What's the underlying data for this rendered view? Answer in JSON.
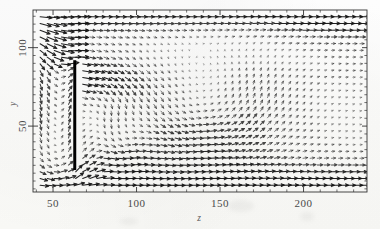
{
  "figure": {
    "name": "velocity-vector-field",
    "background_color": "#fdfdfc",
    "ink_color": "#1a1a1a"
  },
  "chart_data": {
    "type": "quiver",
    "title": "",
    "subtitle": "",
    "xlabel": "z",
    "ylabel": "y",
    "xlim": [
      38,
      238
    ],
    "ylim": [
      8,
      124
    ],
    "grid": false,
    "legend": null,
    "xticks": [
      50,
      100,
      150,
      200
    ],
    "xtick_labels": [
      "50",
      "100",
      "150",
      "200"
    ],
    "yticks": [
      50,
      100
    ],
    "ytick_labels": [
      "50",
      "100"
    ],
    "x_minor_tick_step": 10,
    "y_minor_tick_step": 5,
    "annotations": [
      {
        "name": "vertical-plate",
        "type": "thick-line-segment",
        "x": 63,
        "y_start": 22,
        "y_end": 92,
        "color": "#000000",
        "line_width_px": 3
      }
    ],
    "grid_nx": 46,
    "grid_ny": 26,
    "arrow_scale": 7.4,
    "vortex_center": {
      "z": 138,
      "y": 64
    },
    "secondary_vortex_center": {
      "z": 88,
      "y": 40
    }
  },
  "axes": {
    "x_title": "z",
    "y_title": "y",
    "x_tick_values": [
      "50",
      "100",
      "150",
      "200"
    ],
    "y_tick_values": [
      "100",
      "50"
    ]
  }
}
